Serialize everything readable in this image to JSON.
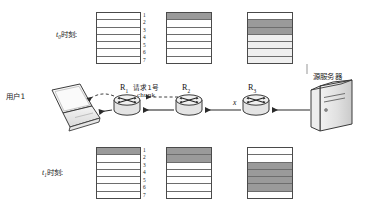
{
  "diagram": {
    "time_labels": {
      "t0": {
        "var": "t",
        "sub": "0",
        "text": "时刻:"
      },
      "t1": {
        "var": "t",
        "sub": "1",
        "text": "时刻:"
      }
    },
    "row_numbers": [
      "1",
      "2",
      "3",
      "4",
      "5",
      "6",
      "7"
    ],
    "blocks_t0": [
      {
        "id": "t0-block-1",
        "numbered": true,
        "rows": [
          "white",
          "white",
          "white",
          "white",
          "white",
          "white",
          "white"
        ]
      },
      {
        "id": "t0-block-2",
        "numbered": false,
        "rows": [
          "dark",
          "white",
          "white",
          "white",
          "white",
          "white",
          "white"
        ]
      },
      {
        "id": "t0-block-3",
        "numbered": false,
        "rows": [
          "white",
          "dark",
          "dark",
          "light",
          "light",
          "light",
          "light"
        ]
      }
    ],
    "blocks_t1": [
      {
        "id": "t1-block-1",
        "numbered": true,
        "rows": [
          "dark",
          "white",
          "white",
          "white",
          "white",
          "white",
          "white"
        ]
      },
      {
        "id": "t1-block-2",
        "numbered": false,
        "rows": [
          "dark",
          "dark",
          "white",
          "white",
          "white",
          "white",
          "white"
        ]
      },
      {
        "id": "t1-block-3",
        "numbered": false,
        "rows": [
          "white",
          "white",
          "dark",
          "dark",
          "dark",
          "dark",
          "white"
        ]
      }
    ],
    "nodes": {
      "client": {
        "label": "用户1",
        "icon": "laptop-icon"
      },
      "router1": {
        "label": "R",
        "sub": "1",
        "icon": "router-icon"
      },
      "router2": {
        "label": "R",
        "sub": "2",
        "icon": "router-icon"
      },
      "router3": {
        "label": "R",
        "sub": "3",
        "icon": "router-icon"
      },
      "server": {
        "label": "源服务器",
        "icon": "server-icon"
      }
    },
    "annotations": {
      "request": {
        "line1": "请求1号",
        "line2": "chunk"
      },
      "rate_x": "x"
    },
    "colors": {
      "dark_row": "#9a9a9a",
      "light_row": "#efefef",
      "stroke": "#4a4a4a",
      "text": "#1c1c1c"
    }
  }
}
